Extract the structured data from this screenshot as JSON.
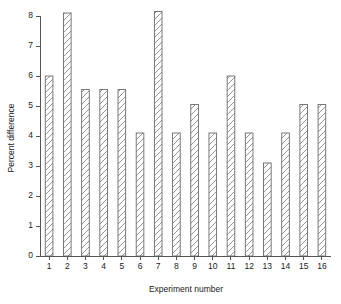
{
  "chart_data": {
    "type": "bar",
    "title": "",
    "xlabel": "Experiment number",
    "ylabel": "Percent difference",
    "categories": [
      "1",
      "2",
      "3",
      "4",
      "5",
      "6",
      "7",
      "8",
      "9",
      "10",
      "11",
      "12",
      "13",
      "14",
      "15",
      "16"
    ],
    "values": [
      6.0,
      8.1,
      5.55,
      5.55,
      5.55,
      4.1,
      8.15,
      4.1,
      5.05,
      4.1,
      6.0,
      4.1,
      3.1,
      4.1,
      5.05,
      5.05
    ],
    "ylim": [
      0,
      8
    ],
    "xlim": [
      0.5,
      16.5
    ],
    "yticks": [
      0,
      1,
      2,
      3,
      4,
      5,
      6,
      7,
      8
    ],
    "ytick_labels": [
      "0",
      "1",
      "2",
      "3",
      "4",
      "5",
      "6",
      "7",
      "8"
    ],
    "xtick_labels": [
      "1",
      "2",
      "3",
      "4",
      "5",
      "6",
      "7",
      "8",
      "9",
      "10",
      "11",
      "12",
      "13",
      "14",
      "15",
      "16"
    ],
    "grid": false,
    "legend": null,
    "bar_style": {
      "fill": "#ffffff",
      "edge_color": "#6b6b6b",
      "hatch": "forward-diagonal",
      "hatch_color": "#7a7a7a"
    },
    "axis_color": "#555555",
    "background": "#ffffff"
  }
}
